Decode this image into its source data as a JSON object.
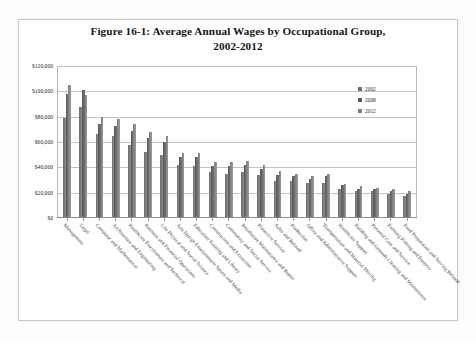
{
  "figure": {
    "title_line1": "Figure 16-1: Average Annual Wages by Occupational Group,",
    "title_line2": "2002-2012"
  },
  "legend": {
    "position": "top-right",
    "entries": [
      {
        "label": "2002",
        "color": "#6e6e6e"
      },
      {
        "label": "2008",
        "color": "#585858"
      },
      {
        "label": "2012",
        "color": "#7c7c7c"
      }
    ]
  },
  "axis": {
    "y_ticks": [
      "$0",
      "$20,000",
      "$40,000",
      "$60,000",
      "$80,000",
      "$100,000",
      "$120,000"
    ],
    "y_tick_values": [
      0,
      20000,
      40000,
      60000,
      80000,
      100000,
      120000
    ]
  },
  "chart_data": {
    "type": "bar",
    "title": "Figure 16-1: Average Annual Wages by Occupational Group, 2002-2012",
    "xlabel": "",
    "ylabel": "",
    "ylim": [
      0,
      120000
    ],
    "grid": true,
    "legend_position": "top-right",
    "categories": [
      "Management",
      "Legal",
      "Computer and Mathematical",
      "Architecture and Engineering",
      "Healthcare Practitioners and Technical",
      "Business and Financial Operations",
      "Life Physical and Social Science",
      "Arts Design Entertainment Sports and Media",
      "Education Training and Library",
      "Construction and Extraction",
      "Community and Social Service",
      "Installation Maintenance and Repair",
      "Protective Service",
      "Sales and Related",
      "Production",
      "Office and Administrative Support",
      "Transportation and Material Moving",
      "Healthcare Support",
      "Building and Grounds Cleaning and Maintenance",
      "Personal Care and Service",
      "Farming Fishing and Forestry",
      "Food Preparation and Serving Related"
    ],
    "series": [
      {
        "name": "2002",
        "color": "#6e6e6e",
        "values": [
          79000,
          88000,
          66000,
          65000,
          58000,
          52000,
          50000,
          42000,
          41000,
          36000,
          35000,
          36000,
          34000,
          29000,
          29000,
          28000,
          28000,
          23000,
          21000,
          21000,
          19000,
          17000
        ]
      },
      {
        "name": "2008",
        "color": "#585858",
        "values": [
          98000,
          101000,
          74000,
          73000,
          69000,
          63000,
          60000,
          48000,
          48000,
          41000,
          41000,
          42000,
          39000,
          34000,
          33000,
          31000,
          33000,
          26000,
          23000,
          23000,
          21000,
          19000
        ]
      },
      {
        "name": "2012",
        "color": "#7c7c7c",
        "values": [
          105000,
          97000,
          80000,
          78000,
          74000,
          68000,
          65000,
          51000,
          51000,
          44000,
          44000,
          45000,
          42000,
          37000,
          35000,
          33000,
          35000,
          27000,
          25000,
          24000,
          23000,
          21000
        ]
      }
    ]
  }
}
